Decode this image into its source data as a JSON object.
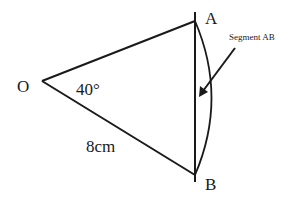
{
  "diagram": {
    "points": {
      "O": {
        "label": "O",
        "x": 42,
        "y": 81
      },
      "A": {
        "label": "A",
        "x": 195,
        "y": 21
      },
      "B": {
        "label": "B",
        "x": 195,
        "y": 175
      }
    },
    "angle_label": "40°",
    "radius_label": "8cm",
    "segment_label": "Segment AB",
    "colors": {
      "stroke": "#1a1a1a",
      "background": "#ffffff"
    }
  }
}
